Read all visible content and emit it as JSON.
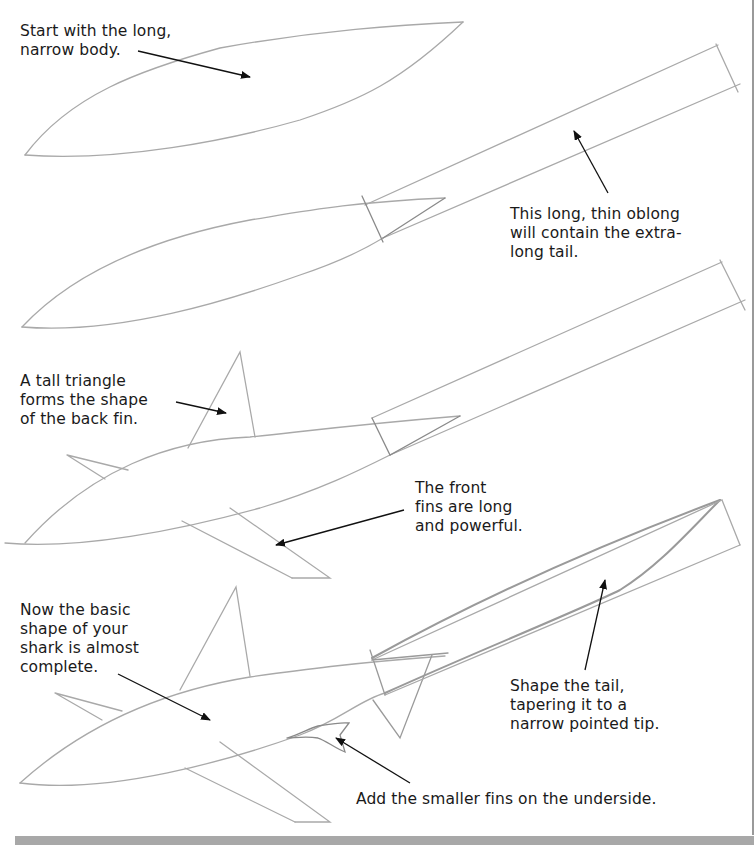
{
  "page": {
    "colors": {
      "pencil": "#a9a9a9",
      "pencil_dark": "#7d7d7d",
      "arrow": "#111111",
      "text": "#1a1a1a",
      "background": "#ffffff",
      "bottom_bar": "#a8a8a8"
    }
  },
  "steps": [
    {
      "id": 1,
      "caption": "Start with the long,\nnarrow body.",
      "elements": [
        "body-outline"
      ]
    },
    {
      "id": 2,
      "caption": "This long, thin oblong\nwill contain the extra-\nlong tail.",
      "elements": [
        "body-outline",
        "tail-oblong",
        "tail-connector-triangle"
      ]
    },
    {
      "id": 3,
      "captions": [
        "A tall triangle\nforms the shape\nof the back fin.",
        "The front\nfins are long\nand powerful."
      ],
      "elements": [
        "body-outline",
        "tail-oblong",
        "back-fin",
        "side-fin",
        "front-fins"
      ]
    },
    {
      "id": 4,
      "captions": [
        "Now the basic\nshape of your\nshark is almost\ncomplete.",
        "Shape the tail,\ntapering it to a\nnarrow pointed tip.",
        "Add the smaller fins on the underside."
      ],
      "elements": [
        "body-outline",
        "tapered-tail",
        "back-fin",
        "side-fin",
        "front-fins",
        "underside-fins"
      ]
    }
  ]
}
